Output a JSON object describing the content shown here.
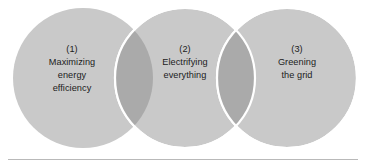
{
  "figure": {
    "background_color": "#ffffff",
    "width": 369,
    "height": 167
  },
  "colors": {
    "circle_fill": "#c9c9c9",
    "circle_overlap_fill": "#aaaaaa",
    "circle_stroke": "#ffffff",
    "text_color": "#1c1c1c",
    "rule_color": "#b9b9b9"
  },
  "circles": [
    {
      "id": "circle-1",
      "number": "(1)",
      "lines": [
        "(1)",
        "Maximizing",
        "energy",
        "efficiency"
      ],
      "cx": 83,
      "cy": 78,
      "r": 70
    },
    {
      "id": "circle-2",
      "number": "(2)",
      "lines": [
        "(2)",
        "Electrifying",
        "everything"
      ],
      "cx": 185,
      "cy": 78,
      "r": 70
    },
    {
      "id": "circle-3",
      "number": "(3)",
      "lines": [
        "(3)",
        "Greening",
        "the grid"
      ],
      "cx": 287,
      "cy": 78,
      "r": 70
    }
  ],
  "labels": {
    "circle1": {
      "line1": "(1)",
      "line2": "Maximizing",
      "line3": "energy",
      "line4": "efficiency"
    },
    "circle2": {
      "line1": "(2)",
      "line2": "Electrifying",
      "line3": "everything"
    },
    "circle3": {
      "line1": "(3)",
      "line2": "Greening",
      "line3": "the grid"
    }
  },
  "rule": {
    "x": 8,
    "y": 159,
    "width": 350
  }
}
